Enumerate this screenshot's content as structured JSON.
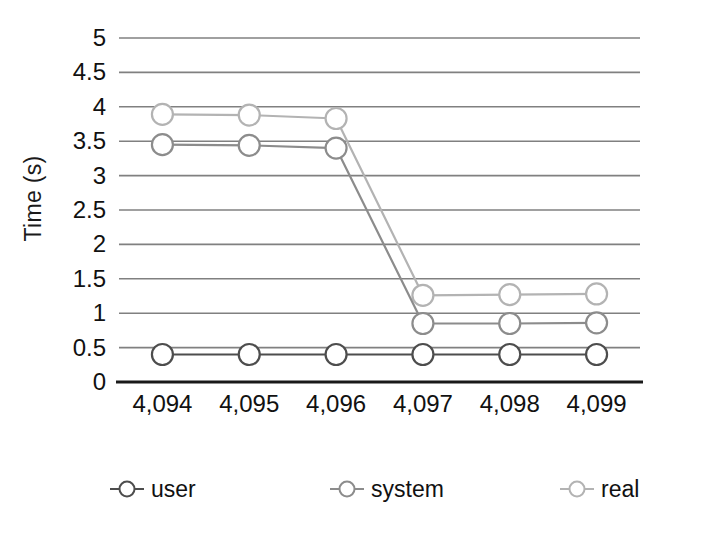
{
  "chart_data": {
    "type": "line",
    "title": "",
    "subtitle": "",
    "xlabel": "",
    "ylabel": "Time (s)",
    "x": [
      4094,
      4095,
      4096,
      4097,
      4098,
      4099
    ],
    "categories": [
      "4,094",
      "4,095",
      "4,096",
      "4,097",
      "4,098",
      "4,099"
    ],
    "xtick_labels": [
      "4,094",
      "4,095",
      "4,096",
      "4,097",
      "4,098",
      "4,099"
    ],
    "ytick_labels": [
      "5",
      "4.5",
      "4",
      "3.5",
      "3",
      "2.5",
      "2",
      "1.5",
      "1",
      "0.5",
      "0"
    ],
    "ytick_values": [
      5,
      4.5,
      4,
      3.5,
      3,
      2.5,
      2,
      1.5,
      1,
      0.5,
      0
    ],
    "ylim": [
      0,
      5
    ],
    "grid": true,
    "grid_axis": "y",
    "legend_position": "bottom",
    "marker": "open-circle",
    "series": [
      {
        "name": "user",
        "color": "#4d4d4d",
        "values": [
          0.4,
          0.4,
          0.4,
          0.4,
          0.4,
          0.4
        ]
      },
      {
        "name": "system",
        "color": "#8c8c8c",
        "values": [
          3.45,
          3.44,
          3.4,
          0.85,
          0.85,
          0.86
        ]
      },
      {
        "name": "real",
        "color": "#b3b3b3",
        "values": [
          3.89,
          3.88,
          3.83,
          1.26,
          1.27,
          1.28
        ]
      }
    ]
  },
  "legend": {
    "items": [
      {
        "label": "user",
        "color": "#4d4d4d"
      },
      {
        "label": "system",
        "color": "#8c8c8c"
      },
      {
        "label": "real",
        "color": "#b3b3b3"
      }
    ]
  },
  "axes": {
    "y_title": "Time (s)"
  }
}
